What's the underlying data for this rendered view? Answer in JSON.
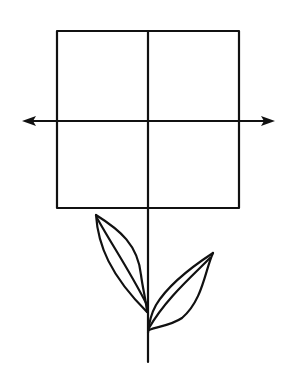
{
  "diagram": {
    "colors": {
      "background": "#ffffff",
      "stroke": "#111111"
    },
    "square": {
      "x": 57,
      "y": 31,
      "width": 182,
      "height": 177
    },
    "horizontal_arrow": {
      "x1": 22,
      "x2": 275,
      "y": 121,
      "heads": [
        "left",
        "right"
      ]
    },
    "vertical_line": {
      "x": 148,
      "y1": 31,
      "y2": 362
    },
    "leaves": [
      {
        "side": "left",
        "tip": [
          96,
          215
        ],
        "base": [
          147,
          310
        ]
      },
      {
        "side": "right",
        "tip": [
          213,
          253
        ],
        "base": [
          148,
          333
        ]
      }
    ]
  }
}
